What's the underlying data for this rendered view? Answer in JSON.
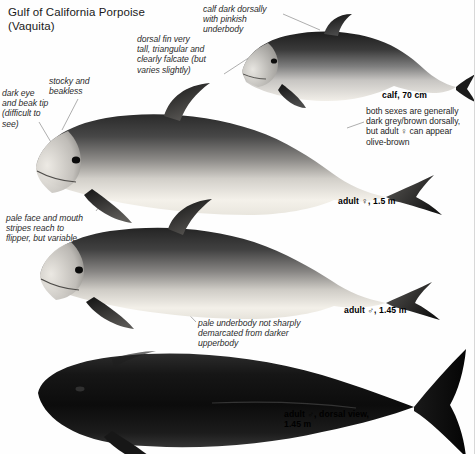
{
  "plate": {
    "title": "Gulf of California Porpoise\n(Vaquita)",
    "background_color": "#fefefe",
    "ink_color": "#1a1a1a"
  },
  "annotations": [
    {
      "id": "dorsal-fin",
      "text": "dorsal fin very\ntall, triangular and\nclearly falcate (but\nvaries slightly)"
    },
    {
      "id": "dark-eye",
      "text": "dark eye\nand beak tip\n(difficult to\nsee)"
    },
    {
      "id": "stocky-beakless",
      "text": "stocky and\nbeakless"
    },
    {
      "id": "pale-face",
      "text": "pale face and mouth\nstripes reach to\nflipper, but variable"
    },
    {
      "id": "calf-dark-dorsally",
      "text": "calf dark dorsally\nwith pinkish\nunderbody"
    },
    {
      "id": "pale-underbody",
      "text": "pale underbody not sharply\ndemarcated from darker\nupperbody"
    }
  ],
  "notes": [
    {
      "id": "both-sexes",
      "text": "both sexes are generally\ndark grey/brown dorsally,\nbut adult ♀ can appear\nolive-brown"
    }
  ],
  "captions": [
    {
      "id": "calf",
      "text": "calf, 70 cm"
    },
    {
      "id": "adult-female",
      "text": "adult ♀, 1.5 m"
    },
    {
      "id": "adult-male",
      "text": "adult ♂, 1.45 m"
    },
    {
      "id": "dorsal-view",
      "text": "adult ♂, dorsal view,\n1.45 m"
    }
  ],
  "specimens": [
    {
      "id": "calf",
      "label": "calf, 70 cm",
      "view": "lateral"
    },
    {
      "id": "adult-female",
      "label": "adult ♀, 1.5 m",
      "view": "lateral"
    },
    {
      "id": "adult-male",
      "label": "adult ♂, 1.45 m",
      "view": "lateral"
    },
    {
      "id": "dorsal-view",
      "label": "adult ♂, dorsal view, 1.45 m",
      "view": "dorsal"
    }
  ]
}
